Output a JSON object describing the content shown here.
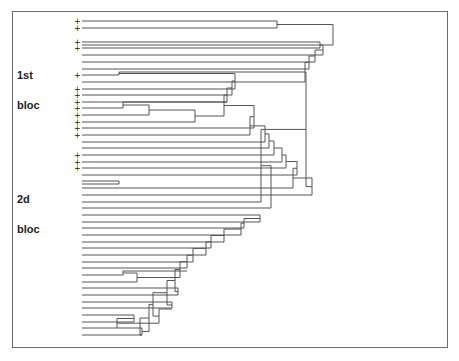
{
  "figure": {
    "type": "dendrogram",
    "labels": [
      {
        "text": "1st",
        "x": 17,
        "y": 76
      },
      {
        "text": "bloc",
        "x": 17,
        "y": 106
      },
      {
        "text": "2d",
        "x": 17,
        "y": 200
      },
      {
        "text": "bloc",
        "x": 17,
        "y": 230
      }
    ],
    "leaf_x": 82,
    "plus_x": 74,
    "line_color": "#555555",
    "leaves": [
      {
        "y": 21,
        "plus": true
      },
      {
        "y": 28,
        "plus": true
      },
      {
        "y": 35,
        "plus": false
      },
      {
        "y": 42,
        "plus": true
      },
      {
        "y": 48,
        "plus": true
      },
      {
        "y": 55,
        "plus": false
      },
      {
        "y": 62,
        "plus": false
      },
      {
        "y": 69,
        "plus": false
      },
      {
        "y": 75,
        "plus": true
      },
      {
        "y": 82,
        "plus": false
      },
      {
        "y": 89,
        "plus": true
      },
      {
        "y": 95,
        "plus": true
      },
      {
        "y": 102,
        "plus": true
      },
      {
        "y": 108,
        "plus": true
      },
      {
        "y": 115,
        "plus": true
      },
      {
        "y": 122,
        "plus": true
      },
      {
        "y": 128,
        "plus": true
      },
      {
        "y": 135,
        "plus": true
      },
      {
        "y": 142,
        "plus": false
      },
      {
        "y": 148,
        "plus": false
      },
      {
        "y": 155,
        "plus": true
      },
      {
        "y": 162,
        "plus": true
      },
      {
        "y": 168,
        "plus": true
      },
      {
        "y": 175,
        "plus": false
      },
      {
        "y": 181,
        "plus": false
      },
      {
        "y": 188,
        "plus": false
      },
      {
        "y": 195,
        "plus": false
      },
      {
        "y": 202,
        "plus": false
      },
      {
        "y": 208,
        "plus": false
      },
      {
        "y": 215,
        "plus": false
      },
      {
        "y": 222,
        "plus": false
      },
      {
        "y": 228,
        "plus": false
      },
      {
        "y": 235,
        "plus": false
      },
      {
        "y": 242,
        "plus": false
      },
      {
        "y": 248,
        "plus": false
      },
      {
        "y": 255,
        "plus": false
      },
      {
        "y": 262,
        "plus": false
      },
      {
        "y": 268,
        "plus": false
      },
      {
        "y": 275,
        "plus": false
      },
      {
        "y": 282,
        "plus": false
      },
      {
        "y": 288,
        "plus": false
      },
      {
        "y": 295,
        "plus": false
      },
      {
        "y": 302,
        "plus": false
      },
      {
        "y": 308,
        "plus": false
      },
      {
        "y": 315,
        "plus": false
      },
      {
        "y": 322,
        "plus": false
      },
      {
        "y": 328,
        "plus": false
      },
      {
        "y": 335,
        "plus": false
      }
    ],
    "merges": [
      {
        "a": 21,
        "b": 28,
        "x": 277
      },
      {
        "a": 24.5,
        "b": 45,
        "x": 333
      },
      {
        "a": 42,
        "b": 48,
        "x": 320
      },
      {
        "a": 45,
        "b": 55,
        "x": 323
      },
      {
        "a": 50,
        "b": 62,
        "x": 315
      },
      {
        "a": 56,
        "b": 69,
        "x": 309
      },
      {
        "a": 62.5,
        "b": 82,
        "x": 305
      },
      {
        "a": 72,
        "b": 75,
        "x": 119
      },
      {
        "a": 73.5,
        "b": 89,
        "x": 235
      },
      {
        "a": 81,
        "b": 95,
        "x": 232
      },
      {
        "a": 88,
        "b": 102,
        "x": 227
      },
      {
        "a": 102,
        "b": 108,
        "x": 123
      },
      {
        "a": 105,
        "b": 115,
        "x": 149
      },
      {
        "a": 110,
        "b": 122,
        "x": 195
      },
      {
        "a": 95,
        "b": 116,
        "x": 224
      },
      {
        "a": 105.5,
        "b": 128,
        "x": 254
      },
      {
        "a": 116.75,
        "b": 135,
        "x": 250
      },
      {
        "a": 125.875,
        "b": 142,
        "x": 265
      },
      {
        "a": 133.9,
        "b": 148,
        "x": 269
      },
      {
        "a": 141,
        "b": 155,
        "x": 274
      },
      {
        "a": 148,
        "b": 162,
        "x": 282
      },
      {
        "a": 155,
        "b": 168,
        "x": 286
      },
      {
        "a": 161.5,
        "b": 175,
        "x": 297
      },
      {
        "a": 181,
        "b": 184,
        "x": 119
      },
      {
        "a": 168.25,
        "b": 188,
        "x": 293
      },
      {
        "a": 178,
        "b": 195,
        "x": 312
      },
      {
        "a": 72.25,
        "b": 186.6,
        "x": 306
      },
      {
        "a": 129.4,
        "b": 202,
        "x": 261
      },
      {
        "a": 165.7,
        "b": 208,
        "x": 271
      },
      {
        "a": 215,
        "b": 222,
        "x": 260
      },
      {
        "a": 218.5,
        "b": 228,
        "x": 244
      },
      {
        "a": 223.2,
        "b": 235,
        "x": 241
      },
      {
        "a": 229.1,
        "b": 242,
        "x": 224
      },
      {
        "a": 235.5,
        "b": 248,
        "x": 211
      },
      {
        "a": 241.8,
        "b": 255,
        "x": 206
      },
      {
        "a": 248.4,
        "b": 262,
        "x": 193
      },
      {
        "a": 255.2,
        "b": 268,
        "x": 187
      },
      {
        "a": 271,
        "b": 275,
        "x": 123
      },
      {
        "a": 273,
        "b": 282,
        "x": 137
      },
      {
        "a": 261.6,
        "b": 277.5,
        "x": 180
      },
      {
        "a": 288,
        "b": 295,
        "x": 178
      },
      {
        "a": 269.5,
        "b": 291.5,
        "x": 175
      },
      {
        "a": 302,
        "b": 308,
        "x": 172
      },
      {
        "a": 280.5,
        "b": 305,
        "x": 167
      },
      {
        "a": 315,
        "b": 322,
        "x": 134
      },
      {
        "a": 318.5,
        "b": 328,
        "x": 117
      },
      {
        "a": 309,
        "b": 323.2,
        "x": 159
      },
      {
        "a": 292.7,
        "b": 316.1,
        "x": 153
      },
      {
        "a": 328,
        "b": 335,
        "x": 142
      },
      {
        "a": 304.4,
        "b": 331.5,
        "x": 149
      },
      {
        "a": 318,
        "b": 335,
        "x": 140
      }
    ]
  }
}
